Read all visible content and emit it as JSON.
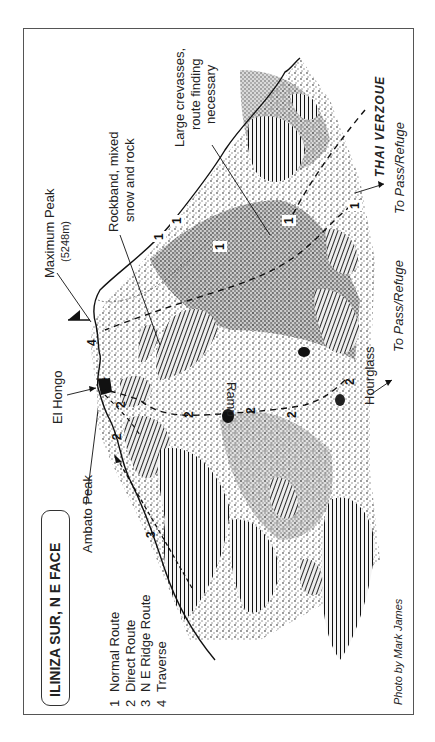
{
  "title": "ILINIZA SUR, N E FACE",
  "legend": [
    {
      "num": "1",
      "label": "Normal Route"
    },
    {
      "num": "2",
      "label": "Direct Route"
    },
    {
      "num": "3",
      "label": "N E Ridge Route"
    },
    {
      "num": "4",
      "label": "Traverse"
    }
  ],
  "labels": {
    "ambato_peak": "Ambato Peak",
    "el_hongo": "El Hongo",
    "maximum_peak": "Maximum Peak",
    "maximum_peak_elev": "(5248m)",
    "rockband_l1": "Rockband, mixed",
    "rockband_l2": "snow and rock",
    "crevasses_l1": "Large crevasses,",
    "crevasses_l2": "route finding",
    "crevasses_l3": "necessary",
    "ramp": "Ramp",
    "hourglass": "Hourglass",
    "to_pass_refuge_1": "To Pass/Refuge",
    "to_pass_refuge_2": "To Pass/Refuge",
    "handwritten": "THAI VERZOUE",
    "credit": "Photo by Mark James"
  },
  "route_markers": {
    "r1": [
      "1",
      "1",
      "1",
      "1",
      "1"
    ],
    "r2": [
      "2",
      "2",
      "2",
      "2",
      "2",
      "2"
    ],
    "r3": [
      "3"
    ],
    "r4": [
      "4",
      "4"
    ]
  }
}
